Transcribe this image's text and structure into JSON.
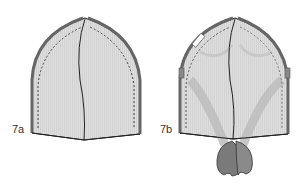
{
  "figure": {
    "panels": [
      {
        "id": "7a",
        "label": "7a",
        "description": "Sewn hat shell with side seams and center seam, stitching lines shown dashed"
      },
      {
        "id": "7b",
        "label": "7b",
        "description": "Hat shell with crossed straps/tabs gathered at bottom center"
      }
    ],
    "colors": {
      "fabric": "#dcdcdc",
      "edge": "#555555",
      "outline": "#222222",
      "strap": "#b8b8b8",
      "knot": "#7a7a7a",
      "stitch": "#444444"
    }
  }
}
